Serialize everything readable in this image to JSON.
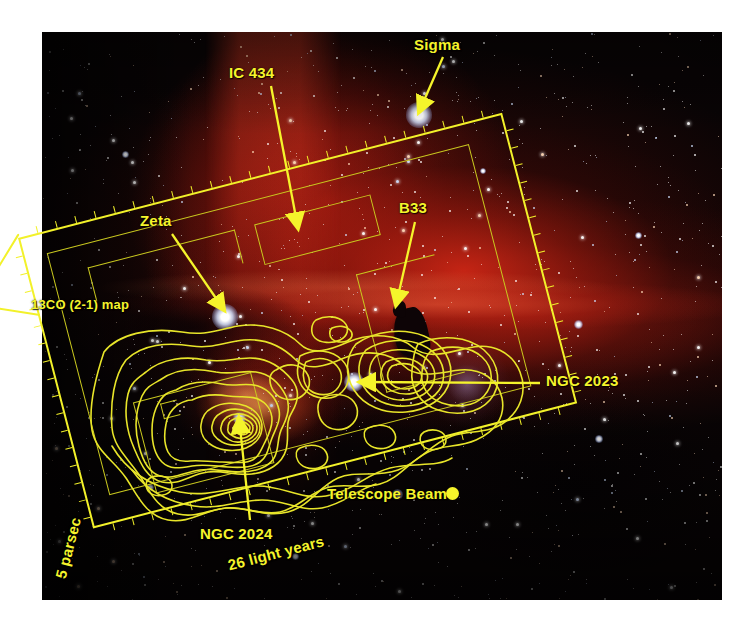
{
  "figure": {
    "kind": "annotated-astronomical-image",
    "background_color": "#ffffff",
    "annotation_color": "#f5f42b",
    "nebula_color": "#d62816"
  },
  "annotations": {
    "sigma": {
      "label": "Sigma",
      "target": "bright star upper right"
    },
    "ic434": {
      "label": "IC 434",
      "target": "emission ridge left of centre"
    },
    "b33": {
      "label": "B33",
      "target": "Horsehead dark silhouette"
    },
    "zeta": {
      "label": "Zeta",
      "target": "bright star at map top edge"
    },
    "comap": {
      "label": "13CO (2-1) map",
      "target": "rotated survey footprint"
    },
    "ngc2023": {
      "label": "NGC 2023",
      "target": "reflection nebula right of centre"
    },
    "ngc2024": {
      "label": "NGC 2024",
      "target": "Flame Nebula contour peak"
    },
    "beam": {
      "label": "Telescope Beam",
      "marker": "filled-circle"
    }
  },
  "scalebars": {
    "horizontal": {
      "label": "26 light years"
    },
    "vertical": {
      "label": "5 parsec"
    }
  },
  "chart_data": {
    "type": "contour-overlay",
    "title": "13CO (2-1) map",
    "overlay_color": "#e8e52a",
    "frame_rotation_deg": -14.5,
    "scale_bars": [
      {
        "axis": "x",
        "label": "26 light years",
        "value": 26,
        "unit": "light years"
      },
      {
        "axis": "y",
        "label": "5 parsec",
        "value": 5,
        "unit": "parsec"
      }
    ],
    "beam_marker": {
      "label": "Telescope Beam",
      "shape": "circle"
    },
    "peaks": [
      {
        "name": "NGC 2024",
        "levels": 9,
        "note": "brightest 13CO peak, nested contours"
      },
      {
        "name": "NGC 2023",
        "levels": 5,
        "note": "secondary peak around reflection nebula"
      }
    ],
    "sources_labelled": [
      "Sigma",
      "IC 434",
      "B33",
      "Zeta",
      "NGC 2023",
      "NGC 2024"
    ]
  }
}
